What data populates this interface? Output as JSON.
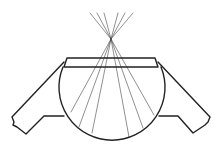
{
  "diagram": {
    "colors": {
      "line": "#222222",
      "ray": "#444444",
      "background": "#ffffff"
    },
    "focal_point": {
      "x": 111,
      "y": 39
    },
    "incoming_rays_top_ends": [
      {
        "x": 90,
        "y": 13
      },
      {
        "x": 97,
        "y": 13
      },
      {
        "x": 104,
        "y": 13
      },
      {
        "x": 118,
        "y": 13
      },
      {
        "x": 125,
        "y": 13
      },
      {
        "x": 133,
        "y": 13
      }
    ],
    "ray_bottom_ends": [
      {
        "x": 71,
        "y": 112
      },
      {
        "x": 79,
        "y": 127
      },
      {
        "x": 92,
        "y": 133
      },
      {
        "x": 129,
        "y": 137
      },
      {
        "x": 143,
        "y": 128
      },
      {
        "x": 154,
        "y": 115
      }
    ],
    "lens_sphere": {
      "cx": 112,
      "cy": 85,
      "r": 53
    },
    "flat_top": {
      "top_y": 58,
      "bottom_y": 67,
      "left_x": 67,
      "right_x": 155
    },
    "labels": []
  }
}
